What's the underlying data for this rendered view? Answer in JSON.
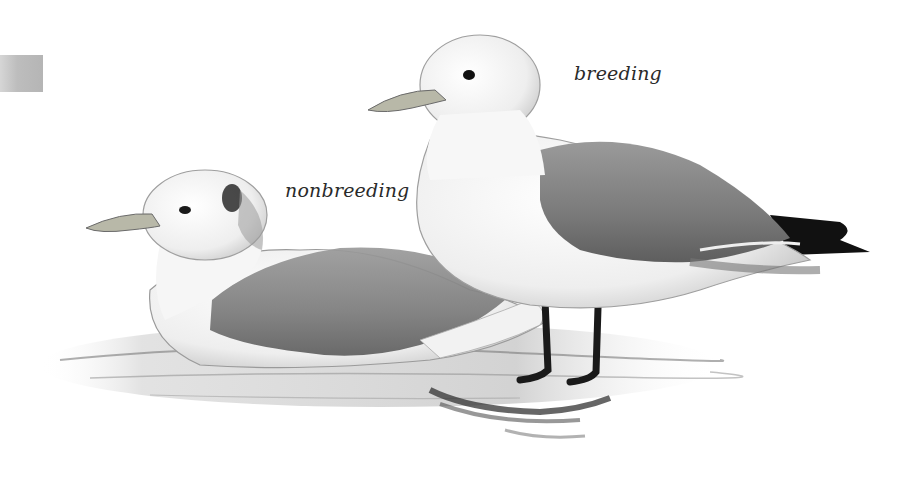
{
  "illustration": {
    "subject": "Two gulls (kittiwakes), field-guide pencil illustration",
    "labels": {
      "breeding": "breeding",
      "nonbreeding": "nonbreeding"
    },
    "colors": {
      "background": "#ffffff",
      "mantle_gray": "#8a8a8a",
      "body_white": "#f4f4f4",
      "wingtip_black": "#111111",
      "legs_black": "#1a1a1a",
      "bill": "#b8b8a8",
      "water_gray": "#9a9a9a",
      "text": "#2a2a2a",
      "edge_swatch": "#bdbdbd"
    }
  }
}
